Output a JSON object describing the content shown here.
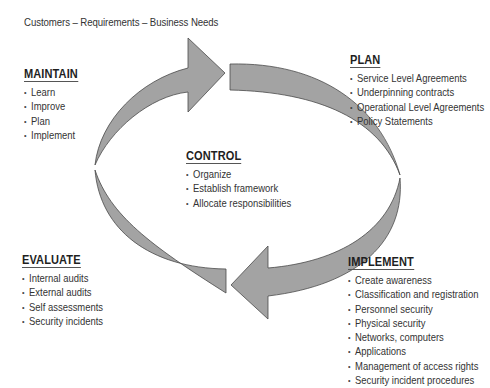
{
  "caption": "Customers – Requirements – Business Needs",
  "colors": {
    "arrow_fill": "#a3a3a3",
    "arrow_stroke": "#4a4a4a",
    "text": "#2a2a2a"
  },
  "phases": {
    "maintain": {
      "title": "MAINTAIN",
      "items": [
        "Learn",
        "Improve",
        "Plan",
        "Implement"
      ]
    },
    "plan": {
      "title": "PLAN",
      "items": [
        "Service Level Agreements",
        "Underpinning contracts",
        "Operational Level Agreements",
        "Policy Statements"
      ]
    },
    "control": {
      "title": "CONTROL",
      "items": [
        "Organize",
        "Establish framework",
        "Allocate responsibilities"
      ]
    },
    "evaluate": {
      "title": "EVALUATE",
      "items": [
        "Internal audits",
        "External audits",
        "Self assessments",
        "Security incidents"
      ]
    },
    "implement": {
      "title": "IMPLEMENT",
      "items": [
        "Create awareness",
        "Classification and registration",
        "Personnel security",
        "Physical security",
        "Networks, computers",
        "Applications",
        "Management of access rights",
        "Security incident procedures"
      ]
    }
  }
}
